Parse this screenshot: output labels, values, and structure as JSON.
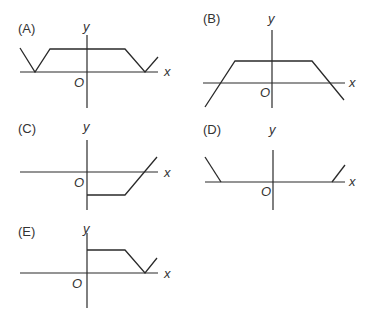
{
  "panels": [
    {
      "id": "A",
      "label": "(A)",
      "x_label": "x",
      "y_label": "y",
      "origin_label": "O",
      "label_pos": [
        18,
        22
      ],
      "ylab_pos": [
        82,
        20
      ],
      "xlab_pos": [
        165,
        65
      ],
      "olab_pos": [
        75,
        76
      ],
      "x_axis": [
        20,
        72,
        158,
        72
      ],
      "y_axis": [
        87,
        35,
        87,
        108
      ],
      "curve": [
        [
          20,
          48
        ],
        [
          35,
          72
        ],
        [
          50,
          49
        ],
        [
          125,
          49
        ],
        [
          145,
          72
        ],
        [
          158,
          57
        ]
      ]
    },
    {
      "id": "B",
      "label": "(B)",
      "x_label": "x",
      "y_label": "y",
      "origin_label": "O",
      "label_pos": [
        203,
        12
      ],
      "ylab_pos": [
        268,
        12
      ],
      "xlab_pos": [
        350,
        76
      ],
      "olab_pos": [
        261,
        86
      ],
      "x_axis": [
        203,
        83,
        345,
        83
      ],
      "y_axis": [
        272,
        30,
        272,
        108
      ],
      "curve": [
        [
          205,
          107
        ],
        [
          235,
          61
        ],
        [
          312,
          61
        ],
        [
          344,
          100
        ]
      ]
    },
    {
      "id": "C",
      "label": "(C)",
      "x_label": "x",
      "y_label": "y",
      "origin_label": "O",
      "label_pos": [
        18,
        122
      ],
      "ylab_pos": [
        82,
        120
      ],
      "xlab_pos": [
        165,
        166
      ],
      "olab_pos": [
        75,
        176
      ],
      "x_axis": [
        20,
        172,
        158,
        172
      ],
      "y_axis": [
        87,
        140,
        87,
        210
      ],
      "curve": [
        [
          87,
          195
        ],
        [
          125,
          195
        ],
        [
          157,
          157
        ]
      ]
    },
    {
      "id": "D",
      "label": "(D)",
      "x_label": "x",
      "y_label": "y",
      "origin_label": "O",
      "label_pos": [
        203,
        123
      ],
      "ylab_pos": [
        268,
        123
      ],
      "xlab_pos": [
        350,
        175
      ],
      "olab_pos": [
        262,
        185
      ],
      "x_axis": [
        205,
        182,
        345,
        182
      ],
      "y_axis": [
        273,
        150,
        273,
        210
      ],
      "curve_segments": [
        [
          [
            205,
            157
          ],
          [
            221,
            182
          ]
        ],
        [
          [
            332,
            182
          ],
          [
            345,
            165
          ]
        ]
      ]
    },
    {
      "id": "E",
      "label": "(E)",
      "x_label": "x",
      "y_label": "y",
      "origin_label": "O",
      "label_pos": [
        18,
        225
      ],
      "ylab_pos": [
        82,
        222
      ],
      "xlab_pos": [
        165,
        267
      ],
      "olab_pos": [
        73,
        277
      ],
      "x_axis": [
        20,
        273,
        158,
        273
      ],
      "y_axis": [
        87,
        233,
        87,
        308
      ],
      "curve": [
        [
          87,
          250
        ],
        [
          125,
          250
        ],
        [
          145,
          273
        ],
        [
          157,
          258
        ]
      ]
    }
  ],
  "colors": {
    "line": "#2a2a2a",
    "text": "#333333",
    "background": "#ffffff"
  }
}
